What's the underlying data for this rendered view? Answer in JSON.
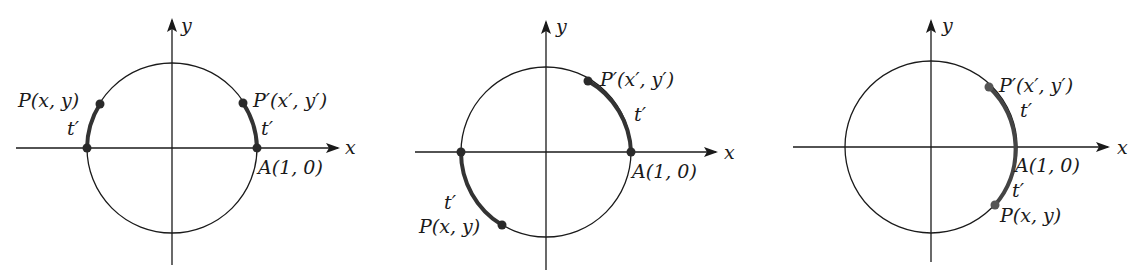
{
  "figure": {
    "panels": [
      {
        "id": "panel-1",
        "center": [
          172,
          148
        ],
        "radius": 85,
        "x_axis": {
          "x1": 16,
          "x2": 338,
          "label": "x",
          "label_pos": [
            344,
            155
          ]
        },
        "y_axis": {
          "y1": 265,
          "y2": 20,
          "label": "y",
          "label_pos": [
            181,
            30
          ]
        },
        "points": [
          {
            "name": "P",
            "label": "P(x, y)",
            "pos": [
              100,
              105
            ],
            "label_pos": [
              18,
              107
            ],
            "anchor": "start"
          },
          {
            "name": "P-prime",
            "label": "P′(x′, y′)",
            "pos": [
              243,
              103
            ],
            "label_pos": [
              254,
              107
            ],
            "anchor": "start"
          },
          {
            "name": "neg-A",
            "label": "",
            "pos": [
              87,
              148
            ]
          },
          {
            "name": "A",
            "label": "A(1, 0)",
            "pos": [
              258,
              148
            ],
            "label_pos": [
              258,
              173
            ],
            "anchor": "start"
          }
        ],
        "arcs": [
          {
            "from": [
              87,
              148
            ],
            "to": [
              100,
              105
            ],
            "sweep": 1,
            "label": "t′",
            "label_pos": [
              66,
              135
            ]
          },
          {
            "from": [
              243,
              103
            ],
            "to": [
              258,
              148
            ],
            "sweep": 1,
            "label": "t′",
            "label_pos": [
              261,
              135
            ]
          }
        ]
      },
      {
        "id": "panel-2",
        "center": [
          546,
          152
        ],
        "radius": 85,
        "x_axis": {
          "x1": 415,
          "x2": 716,
          "label": "x",
          "label_pos": [
            724,
            160
          ]
        },
        "y_axis": {
          "y1": 270,
          "y2": 22,
          "label": "y",
          "label_pos": [
            557,
            32
          ]
        },
        "points": [
          {
            "name": "P",
            "label": "P(x, y)",
            "pos": [
              502,
              225
            ],
            "label_pos": [
              419,
              232
            ],
            "anchor": "start"
          },
          {
            "name": "P-prime",
            "label": "P′(x′, y′)",
            "pos": [
              588,
              82
            ],
            "label_pos": [
              600,
              86
            ],
            "anchor": "start"
          },
          {
            "name": "neg-A",
            "label": "",
            "pos": [
              461,
              152
            ]
          },
          {
            "name": "A",
            "label": "A(1, 0)",
            "pos": [
              631,
              152
            ],
            "label_pos": [
              632,
              178
            ],
            "anchor": "start"
          }
        ],
        "arcs": [
          {
            "from": [
              461,
              152
            ],
            "to": [
              502,
              225
            ],
            "sweep": 0,
            "label": "t′",
            "label_pos": [
              444,
              208
            ]
          },
          {
            "from": [
              588,
              82
            ],
            "to": [
              631,
              152
            ],
            "sweep": 1,
            "label": "t′",
            "label_pos": [
              634,
              120
            ]
          }
        ]
      },
      {
        "id": "panel-3",
        "center": [
          931,
          147
        ],
        "radius": 86,
        "x_axis": {
          "x1": 793,
          "x2": 1108,
          "label": "x",
          "label_pos": [
            1117,
            155
          ]
        },
        "y_axis": {
          "y1": 262,
          "y2": 21,
          "label": "y",
          "label_pos": [
            943,
            31
          ]
        },
        "points": [
          {
            "name": "P",
            "label": "P(x, y)",
            "pos": [
              995,
              205
            ],
            "label_pos": [
              1000,
              222
            ],
            "anchor": "start"
          },
          {
            "name": "P-prime",
            "label": "P′(x′, y′)",
            "pos": [
              989,
              87
            ],
            "label_pos": [
              1000,
              91
            ],
            "anchor": "start"
          },
          {
            "name": "A",
            "label": "A(1, 0)",
            "pos": [
              1017,
              147
            ],
            "label_pos": [
              1015,
              172
            ],
            "anchor": "start"
          }
        ],
        "arcs": [
          {
            "from": [
              989,
              87
            ],
            "to": [
              995,
              205
            ],
            "sweep": 1,
            "label": "t′",
            "label_pos": [
              1020,
              116
            ]
          },
          {
            "from": [
              1017,
              147
            ],
            "to": [
              995,
              205
            ],
            "sweep": 1,
            "label": "",
            "label_pos": [
              1013,
              196
            ],
            "extra_label": "t′"
          }
        ]
      }
    ],
    "labels": {
      "p1_P": "P(x, y)",
      "p1_Pp": "P′(x′, y′)",
      "p1_A": "A(1, 0)",
      "p1_t1": "t′",
      "p1_t2": "t′",
      "p1_x": "x",
      "p1_y": "y",
      "p2_P": "P(x, y)",
      "p2_Pp": "P′(x′, y′)",
      "p2_A": "A(1, 0)",
      "p2_t1": "t′",
      "p2_t2": "t′",
      "p2_x": "x",
      "p2_y": "y",
      "p3_P": "P(x, y)",
      "p3_Pp": "P′(x′, y′)",
      "p3_A": "A(1, 0)",
      "p3_t1": "t′",
      "p3_t2": "t′",
      "p3_x": "x",
      "p3_y": "y"
    },
    "colors": {
      "line": "#1a1a1a",
      "arc": "#333333",
      "dot": "#2a2a2a",
      "background": "#ffffff"
    }
  }
}
